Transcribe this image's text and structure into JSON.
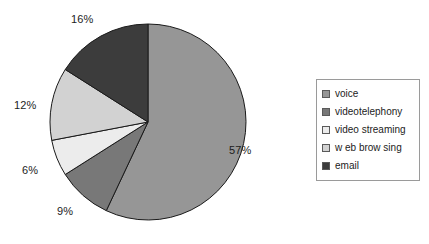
{
  "chart_data": {
    "type": "pie",
    "title": "",
    "categories": [
      "voice",
      "videotelephony",
      "video streaming",
      "web browsing",
      "email"
    ],
    "values": [
      57,
      9,
      6,
      12,
      16
    ],
    "value_labels": [
      "57%",
      "9%",
      "6%",
      "12%",
      "16%"
    ],
    "unit": "percent",
    "start_angle_deg": 0,
    "direction": "clockwise",
    "legend_position": "right",
    "grid": false,
    "colors": [
      "#969696",
      "#787878",
      "#ececec",
      "#d2d2d2",
      "#3c3c3c"
    ],
    "slice_border_color": "#1a1a1a",
    "slices": [
      {
        "label": "voice",
        "value": 57,
        "display": "57%",
        "color": "#969696"
      },
      {
        "label": "videotelephony",
        "value": 9,
        "display": "9%",
        "color": "#787878"
      },
      {
        "label": "video streaming",
        "value": 6,
        "display": "6%",
        "color": "#ececec"
      },
      {
        "label": "web browsing",
        "value": 12,
        "display": "12%",
        "color": "#d2d2d2"
      },
      {
        "label": "email",
        "value": 16,
        "display": "16%",
        "color": "#3c3c3c"
      }
    ]
  },
  "legend": {
    "items": [
      {
        "label": "voice"
      },
      {
        "label": "videotelephony"
      },
      {
        "label": "video streaming"
      },
      {
        "label": "w eb brow sing"
      },
      {
        "label": "email"
      }
    ]
  },
  "labels": {
    "pct_voice": "57%",
    "pct_videotelephony": "9%",
    "pct_video_streaming": "6%",
    "pct_web_browsing": "12%",
    "pct_email": "16%"
  }
}
